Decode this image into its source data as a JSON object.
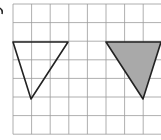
{
  "label": "",
  "grid": {
    "x0": 13,
    "y0": 4,
    "cell": 18.6,
    "cols": 8,
    "rows": 7,
    "line_color": "#9a9a9a"
  },
  "shapes": [
    {
      "name": "outline-triangle",
      "points": [
        [
          13,
          42
        ],
        [
          68,
          42
        ],
        [
          31,
          99
        ]
      ],
      "fill": "none",
      "stroke": "#222222"
    },
    {
      "name": "shaded-triangle",
      "points": [
        [
          106,
          42
        ],
        [
          161,
          42
        ],
        [
          143,
          99
        ]
      ],
      "fill": "#a9a9a9",
      "stroke": "#222222"
    }
  ]
}
